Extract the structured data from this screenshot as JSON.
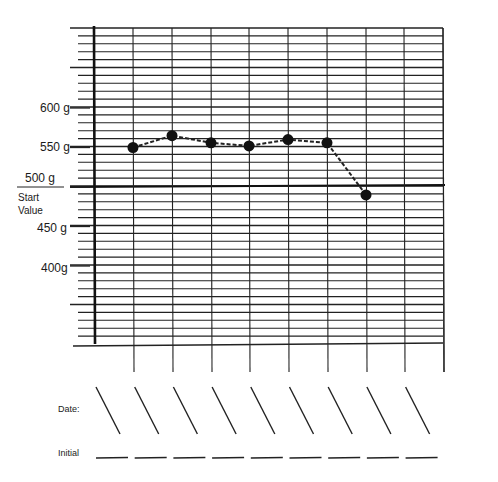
{
  "chart_data": {
    "type": "line",
    "title": "",
    "xlabel": "Date:",
    "ylabel": "",
    "y_unit": "g",
    "ylim": [
      360,
      700
    ],
    "y_ticks": [
      {
        "value": 600,
        "label": "600 g"
      },
      {
        "value": 550,
        "label": "550 g"
      },
      {
        "value": 500,
        "label": "500 g"
      },
      {
        "value": 450,
        "label": "450 g"
      },
      {
        "value": 400,
        "label": "400g"
      }
    ],
    "reference_line": {
      "value": 500,
      "label": "Start Value"
    },
    "columns": 9,
    "x": [
      1,
      2,
      3,
      4,
      5,
      6,
      7
    ],
    "series": [
      {
        "name": "weight",
        "style": "dashed line with filled circle markers",
        "values": [
          550,
          565,
          556,
          552,
          560,
          556,
          490
        ]
      }
    ],
    "grid": true,
    "legend": null
  },
  "labels": {
    "start_line1": "Start",
    "start_line2": "Value",
    "date": "Date:",
    "initial": "Initial"
  },
  "date_slots": 9,
  "initial_slots": 9
}
